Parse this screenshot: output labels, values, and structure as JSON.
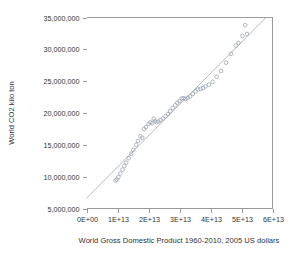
{
  "chart_data": {
    "type": "scatter",
    "title": "",
    "xlabel": "World Gross Domestic Product 1960-2010, 2005 US dollars",
    "ylabel": "World CO2 kilo ton",
    "xlim": [
      0,
      60000000000000
    ],
    "ylim": [
      5000000,
      35000000
    ],
    "grid": false,
    "legend": "none",
    "xtick_labels": [
      "0E+00",
      "1E+13",
      "2E+13",
      "3E+13",
      "4E+13",
      "5E+13",
      "6E+13"
    ],
    "xtick_values": [
      0,
      10000000000000,
      20000000000000,
      30000000000000,
      40000000000000,
      50000000000000,
      60000000000000
    ],
    "ytick_labels": [
      "5,000,000",
      "10,000,000",
      "15,000,000",
      "20,000,000",
      "25,000,000",
      "30,000,000",
      "35,000,000"
    ],
    "ytick_values": [
      5000000,
      10000000,
      15000000,
      20000000,
      25000000,
      30000000,
      35000000
    ],
    "marker": "open-circle",
    "marker_color": "#9aa3b0",
    "trendline": {
      "present": true,
      "color": "#b0b0b0",
      "x_start": 0,
      "y_start": 6600000,
      "x_end": 58500000000000,
      "y_end": 35300000
    },
    "series": [
      {
        "name": "World GDP vs World CO2",
        "points": [
          [
            9400000000000,
            9390000
          ],
          [
            9750000000000,
            9550000
          ],
          [
            10300000000000,
            9950000
          ],
          [
            10900000000000,
            10500000
          ],
          [
            11600000000000,
            11100000
          ],
          [
            12200000000000,
            11700000
          ],
          [
            12800000000000,
            12200000
          ],
          [
            13600000000000,
            12900000
          ],
          [
            14400000000000,
            13600000
          ],
          [
            15100000000000,
            14200000
          ],
          [
            16000000000000,
            15000000
          ],
          [
            16600000000000,
            15600000
          ],
          [
            17400000000000,
            16350000
          ],
          [
            18000000000000,
            16100000
          ],
          [
            18500000000000,
            17500000
          ],
          [
            19200000000000,
            17800000
          ],
          [
            20000000000000,
            18300000
          ],
          [
            20600000000000,
            18550000
          ],
          [
            21200000000000,
            18400000
          ],
          [
            21700000000000,
            19100000
          ],
          [
            22100000000000,
            18700000
          ],
          [
            22600000000000,
            18550000
          ],
          [
            23200000000000,
            18650000
          ],
          [
            23900000000000,
            18900000
          ],
          [
            24700000000000,
            19150000
          ],
          [
            25500000000000,
            19500000
          ],
          [
            26300000000000,
            19850000
          ],
          [
            27000000000000,
            20300000
          ],
          [
            27800000000000,
            20800000
          ],
          [
            28600000000000,
            21200000
          ],
          [
            29300000000000,
            21600000
          ],
          [
            30000000000000,
            21900000
          ],
          [
            30700000000000,
            22300000
          ],
          [
            31300000000000,
            22300000
          ],
          [
            31900000000000,
            22200000
          ],
          [
            32600000000000,
            22400000
          ],
          [
            33400000000000,
            22600000
          ],
          [
            34300000000000,
            23000000
          ],
          [
            35200000000000,
            23400000
          ],
          [
            36000000000000,
            23700000
          ],
          [
            36800000000000,
            23800000
          ],
          [
            37600000000000,
            23900000
          ],
          [
            38400000000000,
            24200000
          ],
          [
            39500000000000,
            24450000
          ],
          [
            40700000000000,
            24900000
          ],
          [
            42000000000000,
            25700000
          ],
          [
            43400000000000,
            26600000
          ],
          [
            45000000000000,
            27900000
          ],
          [
            46600000000000,
            29300000
          ],
          [
            48200000000000,
            30600000
          ],
          [
            49000000000000,
            31000000
          ],
          [
            50300000000000,
            32100000
          ],
          [
            51200000000000,
            33800000
          ],
          [
            51800000000000,
            32400000
          ]
        ]
      }
    ]
  },
  "figure": {
    "ylabel": "World CO2 kilo ton",
    "xlabel": "World Gross Domestic Product 1960-2010, 2005 US dollars"
  }
}
